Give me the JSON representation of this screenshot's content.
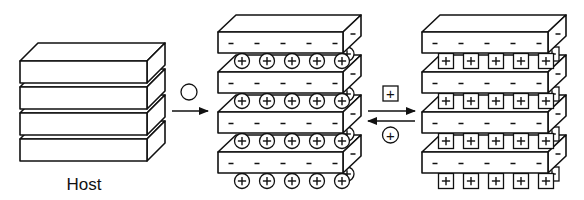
{
  "diagram": {
    "type": "intercalation-schematic",
    "panels": [
      {
        "id": "host",
        "label": "Host",
        "layers": 4,
        "charges": "none"
      },
      {
        "id": "intercalated-circle",
        "label": "",
        "layers": 4,
        "layer_charge": "-",
        "guest_ion": "circle-plus",
        "ions_per_gallery": 5
      },
      {
        "id": "intercalated-square",
        "label": "",
        "layers": 4,
        "layer_charge": "-",
        "guest_ion": "square-plus",
        "ions_per_gallery": 5
      }
    ],
    "arrows": [
      {
        "from": "host",
        "to": "intercalated-circle",
        "label_symbol": "circle (empty)",
        "direction": "forward"
      },
      {
        "from": "intercalated-circle",
        "to": "intercalated-square",
        "label_symbol": "square-plus",
        "direction": "forward"
      },
      {
        "from": "intercalated-square",
        "to": "intercalated-circle",
        "label_symbol": "circle-plus",
        "direction": "reverse"
      }
    ]
  },
  "labels": {
    "host": "Host",
    "minus": "-",
    "plus": "+"
  }
}
